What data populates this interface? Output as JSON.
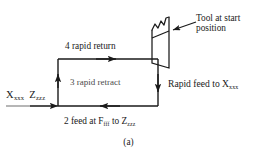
{
  "figure": {
    "caption": "(a)",
    "ink_color": "#1a1a1a",
    "background_color": "#ffffff"
  },
  "labels": {
    "start_position": {
      "x_axis": "X",
      "x_sub": "xxx",
      "z_axis": "Z",
      "z_sub": "zzz"
    },
    "move_4": "4 rapid return",
    "move_3": "3 rapid retract",
    "move_2": {
      "prefix": "2 feed at  F",
      "feed_sub": "fff",
      "middle": "  to  Z",
      "z_sub": "zzz"
    },
    "rapid_feed": {
      "text": "Rapid feed to  X",
      "sub": "xxx"
    },
    "tool_callout_line1": "Tool at start",
    "tool_callout_line2": "position"
  },
  "toolpath": {
    "moves": [
      {
        "id": "entry",
        "label": "X xxx Z zzz",
        "direction": "right",
        "type": "entry"
      },
      {
        "id": "move-2",
        "label": "2 feed at F fff to Z zzz",
        "direction": "left",
        "type": "feed"
      },
      {
        "id": "move-3",
        "label": "3 rapid retract",
        "direction": "up",
        "type": "rapid"
      },
      {
        "id": "move-4",
        "label": "4 rapid return",
        "direction": "right",
        "type": "rapid"
      },
      {
        "id": "move-1",
        "label": "Rapid feed to X xxx",
        "direction": "down",
        "type": "rapid"
      }
    ]
  }
}
